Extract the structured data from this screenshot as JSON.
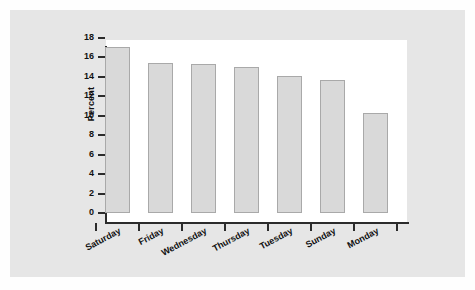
{
  "chart_data": {
    "type": "bar",
    "title": "",
    "xlabel": "",
    "ylabel": "Percent",
    "categories": [
      "Saturday",
      "Friday",
      "Wednesday",
      "Thursday",
      "Tuesday",
      "Sunday",
      "Monday"
    ],
    "values": [
      17.1,
      15.4,
      15.3,
      15.0,
      14.1,
      13.7,
      10.3
    ],
    "ylim": [
      0,
      18
    ],
    "ytick_labels": [
      "0",
      "2",
      "4",
      "6",
      "8",
      "10",
      "12",
      "14",
      "16",
      "18"
    ],
    "ytick_values": [
      0,
      2,
      4,
      6,
      8,
      10,
      12,
      14,
      16,
      18
    ],
    "grid": false,
    "legend": false,
    "bar_fill_color": "#d9d9d9",
    "bar_edge_color": "#a9a9a9",
    "axis_color": "#2b2b2b",
    "plot_background_color": "#ffffff",
    "figure_background_color": "#e6e6e6"
  }
}
